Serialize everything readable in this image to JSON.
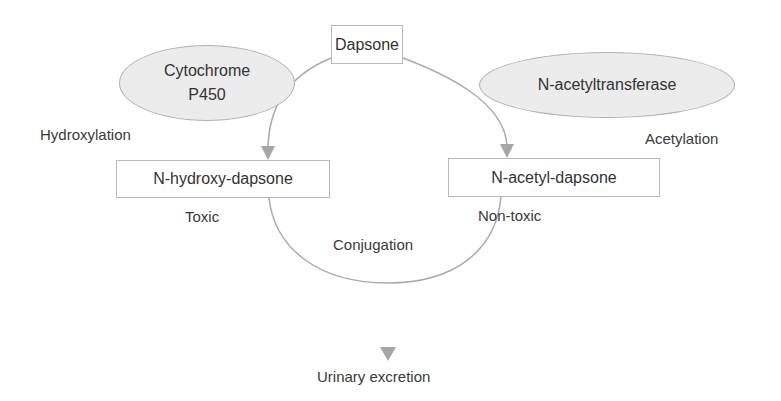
{
  "diagram": {
    "nodes": {
      "dapsone": "Dapsone",
      "n_hydroxy_dapsone": "N-hydroxy-dapsone",
      "n_acetyl_dapsone": "N-acetyl-dapsone"
    },
    "enzymes": {
      "cytochrome_line1": "Cytochrome",
      "cytochrome_line2": "P450",
      "n_acetyltransferase": "N-acetyltransferase"
    },
    "processes": {
      "hydroxylation": "Hydroxylation",
      "acetylation": "Acetylation",
      "conjugation": "Conjugation"
    },
    "annotations": {
      "toxic": "Toxic",
      "non_toxic": "Non-toxic"
    },
    "outcome": {
      "urinary_excretion": "Urinary excretion"
    },
    "colors": {
      "line": "#aaaaaa",
      "arrow": "#a6a6a6",
      "ellipse_fill": "#ececec",
      "box_border": "#b8b8b8"
    }
  }
}
